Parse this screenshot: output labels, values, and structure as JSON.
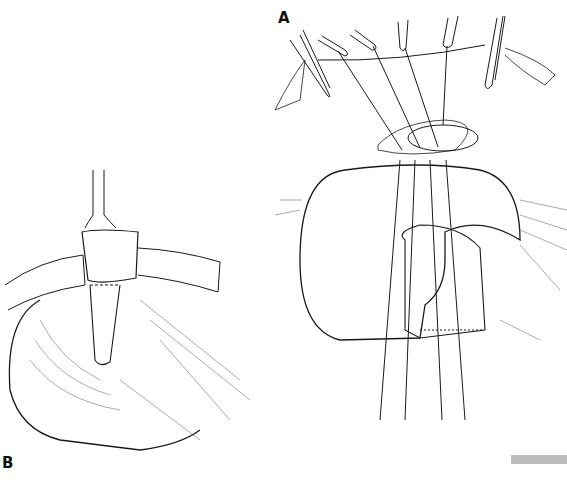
{
  "figure": {
    "panels": [
      {
        "id": "A",
        "label": "A",
        "description": "Sutures passed from abdominal wall opening through stomach wall around tube, forceps retracting wound edges"
      },
      {
        "id": "B",
        "label": "B",
        "description": "Tube exiting through abdominal wall with stomach wrapped and sutured around it"
      }
    ],
    "scale_bar_color": "#bdbdbd",
    "line_color": "#1a1a1a",
    "background": "#ffffff"
  }
}
